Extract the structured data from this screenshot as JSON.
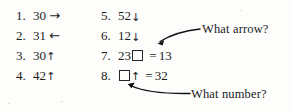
{
  "page": {
    "type": "worksheet-exercise-list",
    "background_color": "#fdfdfc",
    "text_color": "#1c1c1c"
  },
  "columns": {
    "left": {
      "items": [
        {
          "number": "1.",
          "value": "30",
          "symbol": "→",
          "symbol_name": "right-arrow"
        },
        {
          "number": "2.",
          "value": "31",
          "symbol": "←",
          "symbol_name": "left-arrow"
        },
        {
          "number": "3.",
          "value": "30",
          "symbol": "↑",
          "symbol_name": "up-arrow"
        },
        {
          "number": "4.",
          "value": "42",
          "symbol": "↑",
          "symbol_name": "up-arrow"
        }
      ]
    },
    "right": {
      "items": [
        {
          "number": "5.",
          "value": "52",
          "symbol": "↓",
          "symbol_name": "down-arrow"
        },
        {
          "number": "6.",
          "value": "12",
          "symbol": "↓",
          "symbol_name": "down-arrow"
        },
        {
          "number": "7.",
          "value": "23",
          "symbol": "box",
          "symbol_name": "empty-box",
          "equals": "=",
          "result": "13"
        },
        {
          "number": "8.",
          "value": "box",
          "symbol": "↑",
          "symbol_name": "up-arrow",
          "equals": "=",
          "result": "32"
        }
      ]
    }
  },
  "annotations": [
    {
      "id": "what-arrow",
      "label": "What arrow?",
      "points_to": "item-7-box"
    },
    {
      "id": "what-number",
      "label": "What number?",
      "points_to": "item-8-box"
    }
  ],
  "colors": {
    "ink": "#1c1c1c",
    "annotation_line": "#111111"
  }
}
